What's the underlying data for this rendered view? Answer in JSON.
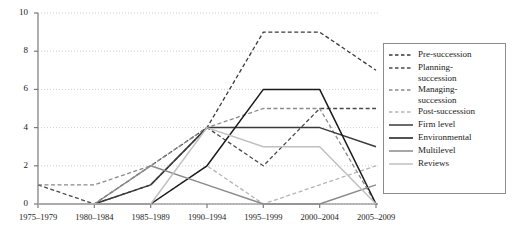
{
  "chart_data": {
    "type": "line",
    "title": "",
    "xlabel": "",
    "ylabel": "",
    "ylim": [
      0,
      10
    ],
    "yticks": [
      0,
      2,
      4,
      6,
      8,
      10
    ],
    "grid": true,
    "legend_position": "right",
    "categories": [
      "1975–1979",
      "1980–1984",
      "1985–1989",
      "1990–1994",
      "1995–1999",
      "2000–2004",
      "2005–2009"
    ],
    "series": [
      {
        "name": "Pre-succession",
        "style": "dashed",
        "color": "#3a3a3a",
        "values": [
          0,
          0,
          1,
          4,
          9,
          9,
          7
        ]
      },
      {
        "name": "Planning-succession",
        "style": "dashed",
        "color": "#4a4a4a",
        "values": [
          1,
          0,
          2,
          4,
          2,
          5,
          5
        ]
      },
      {
        "name": "Managing-succession",
        "style": "dashed",
        "color": "#8a8a8a",
        "values": [
          1,
          1,
          2,
          4,
          5,
          5,
          0
        ]
      },
      {
        "name": "Post-succession",
        "style": "dashed",
        "color": "#b5b5b5",
        "values": [
          0,
          0,
          0,
          2,
          0,
          1,
          2
        ]
      },
      {
        "name": "Firm level",
        "style": "solid",
        "color": "#3a3a3a",
        "values": [
          0,
          0,
          1,
          4,
          4,
          4,
          3
        ]
      },
      {
        "name": "Environmental",
        "style": "solid",
        "color": "#1a1a1a",
        "values": [
          0,
          0,
          0,
          2,
          6,
          6,
          0
        ]
      },
      {
        "name": "Multilevel",
        "style": "solid",
        "color": "#8a8a8a",
        "values": [
          0,
          0,
          2,
          1,
          0,
          0,
          1
        ]
      },
      {
        "name": "Reviews",
        "style": "solid",
        "color": "#c0c0c0",
        "values": [
          0,
          0,
          0,
          4,
          3,
          3,
          0
        ]
      }
    ]
  },
  "legend": {
    "items": [
      {
        "label": "Pre-succession"
      },
      {
        "label": "Planning-\nsuccession"
      },
      {
        "label": "Managing-\nsuccession"
      },
      {
        "label": "Post-succession"
      },
      {
        "label": "Firm level"
      },
      {
        "label": "Environmental"
      },
      {
        "label": "Multilevel"
      },
      {
        "label": "Reviews"
      }
    ]
  },
  "axes": {
    "axis_color": "#7a7a7a",
    "grid_color": "#cfcfcf"
  }
}
